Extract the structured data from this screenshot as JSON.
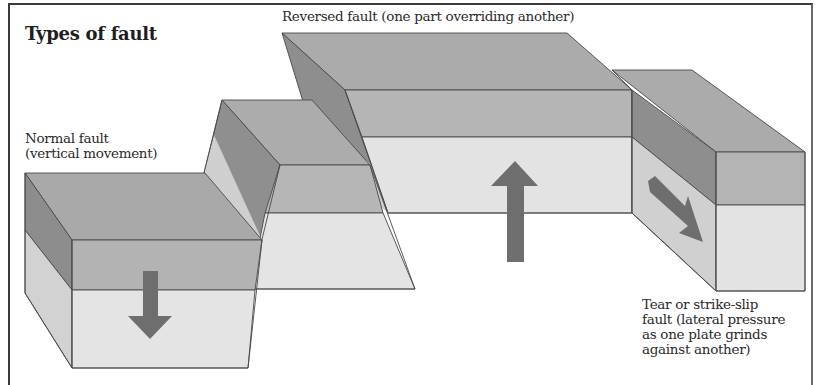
{
  "figure": {
    "title": "Types of fault"
  },
  "labels": {
    "reversed": "Reversed fault (one part overriding another)",
    "normal": [
      "Normal fault",
      "(vertical movement)"
    ],
    "tear": [
      "Tear or strike-slip",
      "fault (lateral pressure",
      "as one plate grinds",
      "against another)"
    ]
  },
  "blocks": [
    {
      "name": "normal-fault-footwall-down",
      "arrow": "down"
    },
    {
      "name": "normal-fault-raised-block",
      "arrow": "none"
    },
    {
      "name": "reversed-fault-overriding-block",
      "arrow": "up"
    },
    {
      "name": "tear-fault-block",
      "arrow": "right-diagonal"
    }
  ],
  "colors": {
    "top_face": "#a9a9a9",
    "upper_band": "#b3b3b3",
    "lower_band": "#e2e2e2",
    "dark_side": "#8e8e8e",
    "light_side": "#cfcfcf",
    "arrow": "#6e6e6e",
    "edge": "#4a4a4a"
  }
}
